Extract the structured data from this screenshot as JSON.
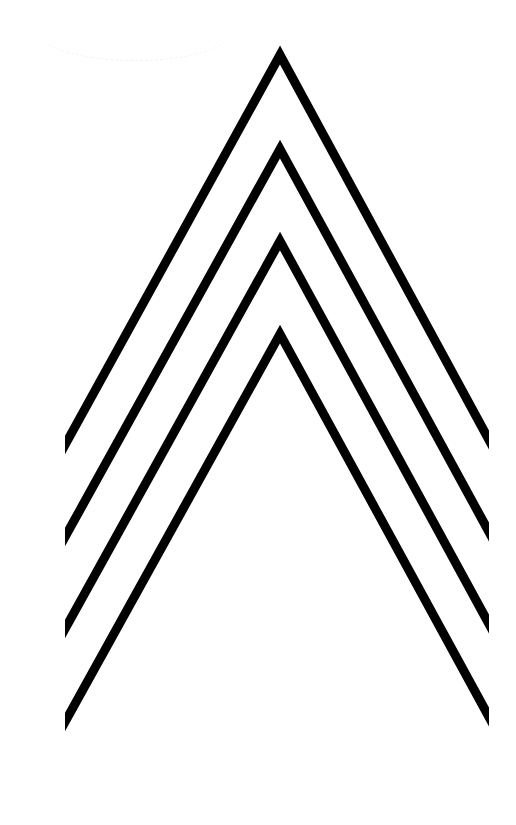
{
  "artwork": {
    "title": "",
    "background": "#ffffff",
    "stroke_color": "#000000",
    "stroke_width": 9,
    "clip": {
      "left": 65,
      "right": 489
    },
    "chevrons": [
      {
        "apex_x": 280,
        "apex_y": 55,
        "left_end_y": 445,
        "right_end_y": 440
      },
      {
        "apex_x": 280,
        "apex_y": 149,
        "left_end_y": 537,
        "right_end_y": 532
      },
      {
        "apex_x": 280,
        "apex_y": 241,
        "left_end_y": 629,
        "right_end_y": 624
      },
      {
        "apex_x": 280,
        "apex_y": 334,
        "left_end_y": 722,
        "right_end_y": 717
      }
    ]
  }
}
